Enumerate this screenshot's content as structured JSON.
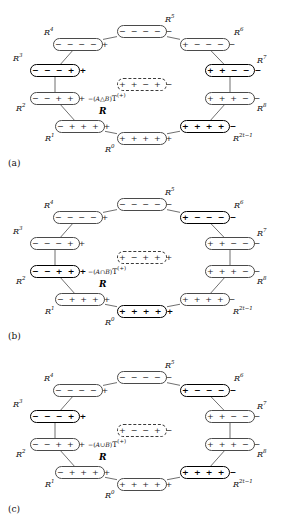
{
  "figure": {
    "type": "diagram",
    "center_label_R": "R"
  },
  "geometry": {
    "node_w": 50,
    "node_h": 13,
    "positions": {
      "R4": {
        "x": 53,
        "y": 38
      },
      "R5": {
        "x": 117,
        "y": 25
      },
      "R6": {
        "x": 180,
        "y": 38
      },
      "R7": {
        "x": 205,
        "y": 64
      },
      "R8": {
        "x": 205,
        "y": 92
      },
      "R2t1": {
        "x": 180,
        "y": 120
      },
      "R0": {
        "x": 117,
        "y": 132
      },
      "R1": {
        "x": 55,
        "y": 120
      },
      "R2": {
        "x": 30,
        "y": 92
      },
      "R3": {
        "x": 30,
        "y": 64
      },
      "CEN": {
        "x": 117,
        "y": 78
      }
    },
    "label_positions": {
      "R4": {
        "x": 44,
        "y": 26
      },
      "R5": {
        "x": 165,
        "y": 13
      },
      "R6": {
        "x": 234,
        "y": 26
      },
      "R7": {
        "x": 257,
        "y": 54
      },
      "R8": {
        "x": 257,
        "y": 102
      },
      "R2t1": {
        "x": 233,
        "y": 132
      },
      "R0": {
        "x": 105,
        "y": 143
      },
      "R1": {
        "x": 45,
        "y": 132
      },
      "R2": {
        "x": 16,
        "y": 102
      },
      "R3": {
        "x": 13,
        "y": 52
      }
    },
    "R_mark": {
      "x": 99,
      "y": 106
    },
    "center_caption": {
      "x": 88,
      "y": 92
    },
    "panel_label": {
      "x": 8,
      "y": 158
    }
  },
  "node_labels": {
    "R4": "R",
    "R4sup": "4",
    "R5": "R",
    "R5sup": "5",
    "R6": "R",
    "R6sup": "6",
    "R7": "R",
    "R7sup": "7",
    "R8": "R",
    "R8sup": "8",
    "R2t1": "R",
    "R2t1sup": "2t−1",
    "R0": "R",
    "R0sup": "0",
    "R1": "R",
    "R1sup": "1",
    "R2": "R",
    "R2sup": "2",
    "R3": "R",
    "R3sup": "3"
  },
  "panels": [
    {
      "id": "a",
      "label": "(a)",
      "center_caption_prefix": "−(",
      "center_caption_set": "A△B",
      "center_caption_suffix": ")",
      "center_caption_T": "T",
      "center_caption_Tsup": "(+)",
      "center_node": "+ + − + −",
      "nodes": {
        "R4": {
          "value": "− − − − +",
          "bold": false
        },
        "R5": {
          "value": "− − − − −",
          "bold": false
        },
        "R6": {
          "value": "+ − − − −",
          "bold": false
        },
        "R7": {
          "value": "+ + − − −",
          "bold": true
        },
        "R8": {
          "value": "+ + + − −",
          "bold": false
        },
        "R2t1": {
          "value": "+ + + + −",
          "bold": true
        },
        "R0": {
          "value": "+ + + + +",
          "bold": false
        },
        "R1": {
          "value": "− + + + +",
          "bold": false
        },
        "R2": {
          "value": "− − + + +",
          "bold": false
        },
        "R3": {
          "value": "− − − + +",
          "bold": true
        }
      }
    },
    {
      "id": "b",
      "label": "(b)",
      "center_caption_prefix": "−(",
      "center_caption_set": "A∩B",
      "center_caption_suffix": ")",
      "center_caption_T": "T",
      "center_caption_Tsup": "(+)",
      "center_node": "+ − + + +",
      "nodes": {
        "R4": {
          "value": "− − − − +",
          "bold": false
        },
        "R5": {
          "value": "− − − − −",
          "bold": false
        },
        "R6": {
          "value": "+ − − − −",
          "bold": true
        },
        "R7": {
          "value": "+ + − − −",
          "bold": false
        },
        "R8": {
          "value": "+ + + − −",
          "bold": false
        },
        "R2t1": {
          "value": "+ + + + −",
          "bold": false
        },
        "R0": {
          "value": "+ + + + +",
          "bold": true
        },
        "R1": {
          "value": "− + + + +",
          "bold": false
        },
        "R2": {
          "value": "− − + + +",
          "bold": true
        },
        "R3": {
          "value": "− − − + +",
          "bold": false
        }
      }
    },
    {
      "id": "c",
      "label": "(c)",
      "center_caption_prefix": "−(",
      "center_caption_set": "A∪B",
      "center_caption_suffix": ")",
      "center_caption_T": "T",
      "center_caption_Tsup": "(+)",
      "center_node": "+ − − + −",
      "nodes": {
        "R4": {
          "value": "− − − − +",
          "bold": false
        },
        "R5": {
          "value": "− − − − −",
          "bold": false
        },
        "R6": {
          "value": "+ − − − −",
          "bold": true
        },
        "R7": {
          "value": "+ + − − −",
          "bold": false
        },
        "R8": {
          "value": "+ + + − −",
          "bold": false
        },
        "R2t1": {
          "value": "+ + + + −",
          "bold": true
        },
        "R0": {
          "value": "+ + + + +",
          "bold": false
        },
        "R1": {
          "value": "− + + + +",
          "bold": false
        },
        "R2": {
          "value": "− − + + +",
          "bold": false
        },
        "R3": {
          "value": "− − − + +",
          "bold": true
        }
      }
    }
  ]
}
